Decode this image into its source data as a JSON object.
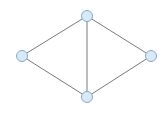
{
  "diagram": {
    "type": "graph",
    "width": 166,
    "height": 114,
    "colors": {
      "background": "#ffffff",
      "edge": "#7a7a7a",
      "node_fill": "#d8eaf8",
      "node_stroke": "#86aacb"
    },
    "node_radius": 5.5,
    "nodes": [
      {
        "id": "top",
        "x": 87,
        "y": 16
      },
      {
        "id": "left",
        "x": 22,
        "y": 56
      },
      {
        "id": "right",
        "x": 151,
        "y": 56
      },
      {
        "id": "bottom",
        "x": 87,
        "y": 97
      }
    ],
    "edges": [
      {
        "from": "top",
        "to": "left"
      },
      {
        "from": "top",
        "to": "right"
      },
      {
        "from": "top",
        "to": "bottom"
      },
      {
        "from": "left",
        "to": "bottom"
      },
      {
        "from": "right",
        "to": "bottom"
      }
    ]
  }
}
